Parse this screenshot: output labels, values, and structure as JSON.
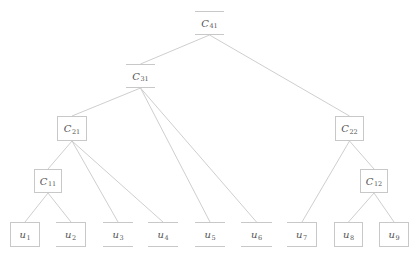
{
  "diagram": {
    "type": "tree",
    "nodes": [
      {
        "id": "C41",
        "base": "C",
        "sub": "41",
        "x": 195,
        "y": 11,
        "w": 29,
        "h": 24,
        "style": "tb"
      },
      {
        "id": "C31",
        "base": "C",
        "sub": "31",
        "x": 126,
        "y": 64,
        "w": 29,
        "h": 24,
        "style": "tb"
      },
      {
        "id": "C21",
        "base": "C",
        "sub": "21",
        "x": 57,
        "y": 116,
        "w": 30,
        "h": 25,
        "style": "full"
      },
      {
        "id": "C22",
        "base": "C",
        "sub": "22",
        "x": 335,
        "y": 116,
        "w": 29,
        "h": 25,
        "style": "full"
      },
      {
        "id": "C11",
        "base": "C",
        "sub": "11",
        "x": 34,
        "y": 169,
        "w": 28,
        "h": 24,
        "style": "full"
      },
      {
        "id": "C12",
        "base": "C",
        "sub": "12",
        "x": 360,
        "y": 169,
        "w": 28,
        "h": 24,
        "style": "full"
      },
      {
        "id": "u1",
        "base": "u",
        "sub": "1",
        "x": 10,
        "y": 222,
        "w": 30,
        "h": 25,
        "style": "full"
      },
      {
        "id": "u2",
        "base": "u",
        "sub": "2",
        "x": 56,
        "y": 222,
        "w": 30,
        "h": 25,
        "style": "tbr"
      },
      {
        "id": "u3",
        "base": "u",
        "sub": "3",
        "x": 103,
        "y": 222,
        "w": 30,
        "h": 25,
        "style": "tb"
      },
      {
        "id": "u4",
        "base": "u",
        "sub": "4",
        "x": 148,
        "y": 222,
        "w": 30,
        "h": 25,
        "style": "tb"
      },
      {
        "id": "u5",
        "base": "u",
        "sub": "5",
        "x": 195,
        "y": 222,
        "w": 30,
        "h": 25,
        "style": "tb"
      },
      {
        "id": "u6",
        "base": "u",
        "sub": "6",
        "x": 241,
        "y": 222,
        "w": 31,
        "h": 25,
        "style": "tb"
      },
      {
        "id": "u7",
        "base": "u",
        "sub": "7",
        "x": 287,
        "y": 222,
        "w": 30,
        "h": 25,
        "style": "tbr"
      },
      {
        "id": "u8",
        "base": "u",
        "sub": "8",
        "x": 334,
        "y": 222,
        "w": 29,
        "h": 25,
        "style": "full"
      },
      {
        "id": "u9",
        "base": "u",
        "sub": "9",
        "x": 379,
        "y": 222,
        "w": 30,
        "h": 25,
        "style": "full"
      }
    ],
    "edges": [
      {
        "from": "C41",
        "to": "C31"
      },
      {
        "from": "C41",
        "to": "C22"
      },
      {
        "from": "C31",
        "to": "C21"
      },
      {
        "from": "C31",
        "to": "u5"
      },
      {
        "from": "C31",
        "to": "u6"
      },
      {
        "from": "C21",
        "to": "C11"
      },
      {
        "from": "C21",
        "to": "u3"
      },
      {
        "from": "C21",
        "to": "u4"
      },
      {
        "from": "C11",
        "to": "u1"
      },
      {
        "from": "C11",
        "to": "u2"
      },
      {
        "from": "C22",
        "to": "u7"
      },
      {
        "from": "C22",
        "to": "C12"
      },
      {
        "from": "C12",
        "to": "u8"
      },
      {
        "from": "C12",
        "to": "u9"
      }
    ],
    "edge_color": "#c8c8c8"
  }
}
